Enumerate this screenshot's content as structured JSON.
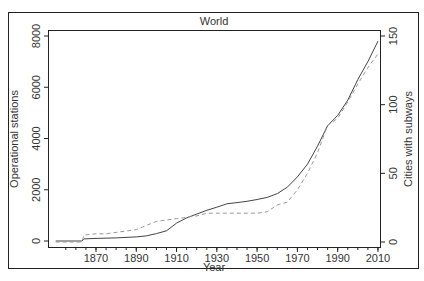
{
  "chart_data": {
    "type": "line",
    "title": "World",
    "xlabel": "Year",
    "ylabel": "Operational stations",
    "y2label": "Cities with subways",
    "xlim": [
      1850,
      2012
    ],
    "ylim": [
      0,
      8000
    ],
    "y2lim": [
      0,
      150
    ],
    "x_ticks": [
      1870,
      1890,
      1910,
      1930,
      1950,
      1970,
      1990,
      2010
    ],
    "y_ticks": [
      0,
      2000,
      4000,
      6000,
      8000
    ],
    "y2_ticks": [
      0,
      50,
      100,
      150
    ],
    "grid": false,
    "legend": null,
    "series": [
      {
        "name": "Operational stations",
        "axis": "left",
        "style": "solid",
        "color": "#444444",
        "x": [
          1850,
          1863,
          1864,
          1870,
          1880,
          1890,
          1895,
          1900,
          1905,
          1910,
          1915,
          1920,
          1925,
          1930,
          1935,
          1940,
          1945,
          1950,
          1955,
          1960,
          1965,
          1970,
          1975,
          1980,
          1985,
          1990,
          1995,
          2000,
          2005,
          2010
        ],
        "values": [
          0,
          0,
          80,
          100,
          120,
          160,
          200,
          290,
          400,
          700,
          900,
          1050,
          1200,
          1320,
          1450,
          1500,
          1550,
          1620,
          1700,
          1850,
          2100,
          2500,
          3000,
          3700,
          4500,
          4900,
          5500,
          6300,
          7000,
          7800
        ]
      },
      {
        "name": "Cities with subways",
        "axis": "right",
        "style": "dashed",
        "color": "#999999",
        "x": [
          1850,
          1863,
          1864,
          1870,
          1875,
          1880,
          1885,
          1890,
          1895,
          1900,
          1905,
          1910,
          1915,
          1920,
          1925,
          1930,
          1935,
          1940,
          1945,
          1950,
          1955,
          1960,
          1965,
          1970,
          1975,
          1980,
          1985,
          1990,
          1995,
          2000,
          2005,
          2010
        ],
        "values": [
          0,
          0,
          5,
          6,
          6,
          7,
          8,
          9,
          12,
          15,
          16,
          17,
          18,
          19,
          21,
          21,
          21,
          21,
          21,
          21,
          22,
          27,
          29,
          38,
          50,
          65,
          85,
          90,
          102,
          115,
          127,
          137
        ]
      }
    ]
  }
}
